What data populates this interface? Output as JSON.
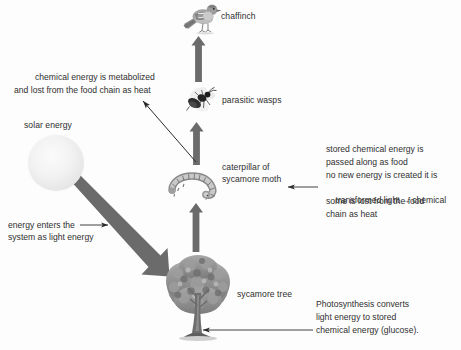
{
  "diagram": {
    "background_color": "#fdfdfd",
    "arrow_color": "#6b6b6b",
    "thin_arrow_color": "#2b2b2b",
    "text_color": "#2f2f2f"
  },
  "organisms": [
    {
      "id": "chaffinch",
      "label": "chaffinch",
      "icon": "bird-icon"
    },
    {
      "id": "wasp",
      "label": "parasitic wasps",
      "icon": "wasp-icon"
    },
    {
      "id": "caterpillar",
      "label_line1": "caterpillar of",
      "label_line2": "sycamore moth",
      "icon": "caterpillar-icon"
    },
    {
      "id": "tree",
      "label": "sycamore tree",
      "icon": "tree-icon"
    },
    {
      "id": "sun",
      "label": "solar energy",
      "icon": "sun-icon"
    }
  ],
  "labels": {
    "chaffinch": "chaffinch",
    "parasitic_wasps": "parasitic wasps",
    "caterpillar_line1": "caterpillar of",
    "caterpillar_line2": "sycamore moth",
    "sycamore_tree": "sycamore tree",
    "solar_energy": "solar energy"
  },
  "annotations": {
    "heat_loss": {
      "line1": "chemical energy is metabolized",
      "line2": "and lost from the food chain as heat"
    },
    "light_entry": {
      "line1": "energy enters the",
      "line2": "system as light energy"
    },
    "stored_energy": {
      "line1": "stored chemical energy is",
      "line2": "passed along as food",
      "line3": "no new energy is created it is",
      "line4_a": "transformed light",
      "line4_arrow": "→",
      "line4_b": "chemical",
      "line5": "some is lost from the food",
      "line6": "chain as heat"
    },
    "photosynthesis": {
      "line1": "Photosynthesis converts",
      "line2": "light energy to stored",
      "line3": "chemical energy (glucose)."
    }
  },
  "arrows": [
    {
      "name": "arrow-wasp-to-chaffinch",
      "type": "thick-up"
    },
    {
      "name": "arrow-caterpillar-to-wasp",
      "type": "thick-up"
    },
    {
      "name": "arrow-tree-to-caterpillar",
      "type": "thick-up"
    },
    {
      "name": "arrow-sun-to-tree",
      "type": "thick-diagonal"
    },
    {
      "name": "arrow-heat-loss",
      "type": "thin-diagonal"
    },
    {
      "name": "arrow-light-entry-pointer",
      "type": "thin-right"
    },
    {
      "name": "arrow-stored-energy-pointer",
      "type": "thin-left"
    },
    {
      "name": "arrow-photosynthesis-pointer",
      "type": "thin-left"
    }
  ]
}
